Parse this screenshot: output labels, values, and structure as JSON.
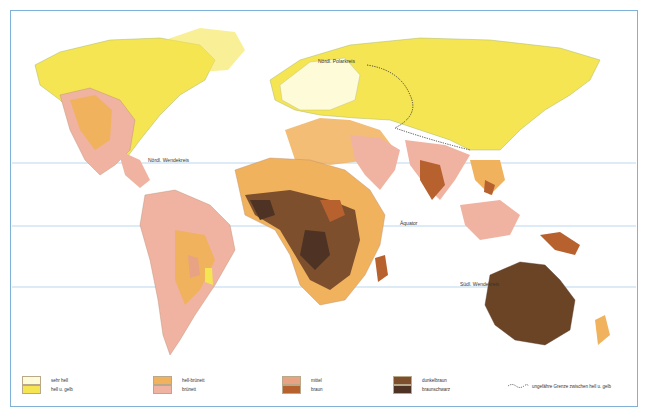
{
  "map": {
    "labels": {
      "arctic_circle": "Nördl. Polarkreis",
      "tropic_cancer": "Nördl. Wendekreis",
      "equator": "Äquator",
      "tropic_capricorn": "Südl. Wendekreis"
    },
    "colors": {
      "sehr_hell": "#fdfbd8",
      "hell_gelb": "#f5e552",
      "hell_bruenett": "#f1b25e",
      "bruenett": "#f0b3a1",
      "mittel": "#e7a383",
      "braun": "#b7612f",
      "dunkelbraun": "#7d4f2c",
      "braunschwarz": "#4e3324",
      "water_lines": "#9cc6e2",
      "frame": "#7fb2d6"
    }
  },
  "legend": [
    {
      "label": "sehr hell",
      "color": "#fdfbd8"
    },
    {
      "label": "hell u. gelb",
      "color": "#f5e552"
    },
    {
      "label": "hell-brünett",
      "color": "#f1b25e"
    },
    {
      "label": "brünett",
      "color": "#f0b3a1"
    },
    {
      "label": "mittel",
      "color": "#e7a383"
    },
    {
      "label": "braun",
      "color": "#b7612f"
    },
    {
      "label": "dunkelbraun",
      "color": "#7d4f2c"
    },
    {
      "label": "braunschwarz",
      "color": "#4e3324"
    }
  ],
  "legend_line": "ungefähre Grenze zwischen hell u. gelb"
}
